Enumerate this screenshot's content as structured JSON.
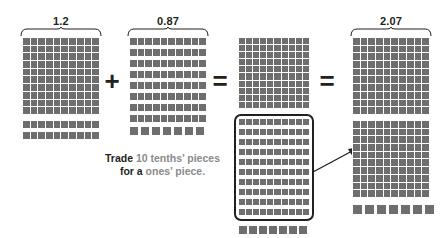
{
  "diagram": {
    "title_type": "decimal-addition-base-ten-blocks",
    "operands": [
      {
        "label": "1.2",
        "flats": 1,
        "rods": 2,
        "units": 0
      },
      {
        "label": "0.87",
        "flats": 0,
        "rods": 8,
        "units": 7
      }
    ],
    "intermediate": {
      "label": "",
      "flats": 1,
      "rods": 10,
      "units": 7,
      "highlight_note": "ten tenths rods enclosed in rounded box"
    },
    "result": {
      "label": "2.07",
      "flats": 2,
      "rods": 0,
      "units": 7
    },
    "operators": {
      "plus": "+",
      "equals_first": "=",
      "equals_second": "="
    },
    "caption": {
      "line1_strong": "Trade",
      "line1_rest": " 10 tenths’ pieces",
      "line2_strong": "for a",
      "line2_rest": " ones’ piece."
    },
    "colors": {
      "block_fill": "#6e6e6e",
      "block_grid_line": "#ffffff",
      "text_dark": "#231f20",
      "text_gray": "#8a8a8a",
      "background": "#ffffff"
    }
  }
}
